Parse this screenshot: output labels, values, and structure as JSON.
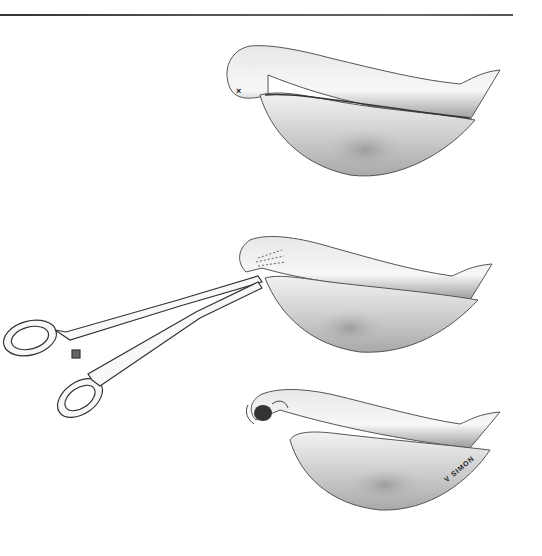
{
  "figure": {
    "panels": [
      {
        "id": "panel-1",
        "description": "stomach with marked point",
        "marker": "×"
      },
      {
        "id": "panel-2",
        "description": "forceps clamping tissue"
      },
      {
        "id": "panel-3",
        "description": "sutured opening"
      }
    ],
    "signature": "V SIMON"
  }
}
